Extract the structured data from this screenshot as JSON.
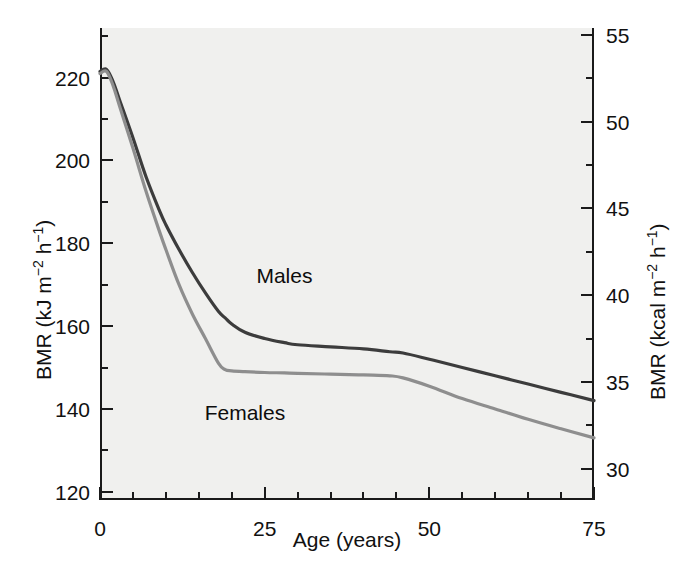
{
  "chart_data": {
    "type": "line",
    "title": "",
    "xlabel": "Age (years)",
    "ylabel": "BMR (kJ m−2 h−1)",
    "y2label": "BMR (kcal m−2 h−1)",
    "xlim": [
      0,
      75
    ],
    "ylim": [
      118,
      232
    ],
    "y2lim": [
      28.2,
      55.4
    ],
    "grid": false,
    "legend_position": "inline-annotations",
    "x_ticks": [
      0,
      25,
      50,
      75
    ],
    "x_tick_labels": [
      "0",
      "25",
      "50",
      "75"
    ],
    "x_minor_step": 5,
    "y_ticks": [
      120,
      140,
      160,
      180,
      200,
      220
    ],
    "y_tick_labels": [
      "120",
      "140",
      "160",
      "180",
      "200",
      "220"
    ],
    "y_minor_step": 10,
    "y2_ticks": [
      30,
      35,
      40,
      45,
      50,
      55
    ],
    "y2_tick_labels": [
      "30",
      "35",
      "40",
      "45",
      "50",
      "55"
    ],
    "y2_minor_step": 2.5,
    "units": {
      "left": "kJ m-2 h-1",
      "right": "kcal m-2 h-1"
    },
    "conversion_note": "1 kcal = 4.184 kJ",
    "series": [
      {
        "name": "Males",
        "color": "#3c3c3c",
        "label_x": 28,
        "label_y": 172,
        "x": [
          0,
          1,
          2,
          3,
          5,
          7,
          9,
          10,
          12,
          14,
          16,
          18,
          19,
          20,
          22,
          25,
          28,
          30,
          35,
          40,
          44,
          46,
          50,
          55,
          60,
          65,
          70,
          75
        ],
        "values": [
          221.5,
          222.0,
          219.0,
          214.5,
          205.5,
          196.0,
          188.0,
          184.5,
          178.5,
          173.0,
          168.0,
          163.5,
          162.0,
          160.5,
          158.5,
          157.0,
          156.0,
          155.5,
          155.0,
          154.5,
          153.8,
          153.5,
          152.0,
          150.0,
          148.0,
          146.0,
          144.0,
          142.0
        ]
      },
      {
        "name": "Females",
        "color": "#8e8e8e",
        "label_x": 22,
        "label_y": 139,
        "x": [
          0,
          1,
          2,
          3,
          5,
          7,
          9,
          10,
          12,
          14,
          16,
          18,
          19,
          20,
          22,
          25,
          28,
          30,
          35,
          40,
          44,
          46,
          50,
          55,
          60,
          65,
          70,
          75
        ],
        "values": [
          221.0,
          221.5,
          218.0,
          213.0,
          203.0,
          192.5,
          183.0,
          178.5,
          170.0,
          163.0,
          157.0,
          151.0,
          149.5,
          149.2,
          149.0,
          148.8,
          148.7,
          148.6,
          148.4,
          148.2,
          148.0,
          147.5,
          145.5,
          142.5,
          140.0,
          137.5,
          135.2,
          133.0
        ]
      }
    ]
  },
  "figure": {
    "caption": ""
  },
  "axes": {
    "left_title_main": "BMR (kJ m",
    "left_sup1": "−2",
    "left_mid": " h",
    "left_sup2": "−1",
    "left_end": ")",
    "right_title_main": "BMR (kcal m",
    "right_sup1": "−2",
    "right_mid": " h",
    "right_sup2": "−1",
    "right_end": ")",
    "x_title": "Age (years)"
  }
}
